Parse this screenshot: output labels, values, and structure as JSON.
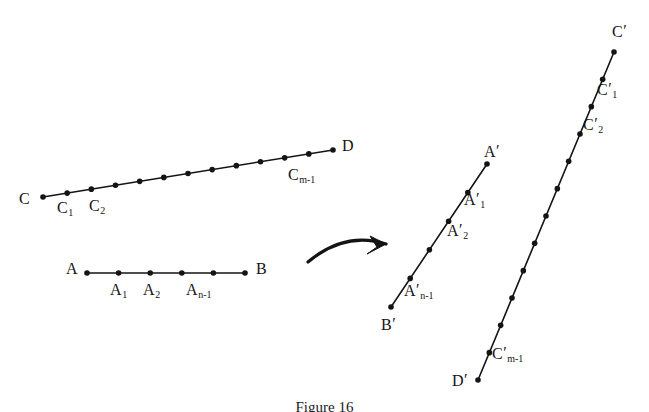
{
  "figure": {
    "caption": "Figure 16",
    "caption_top": 399,
    "background_color": "#ffffff",
    "ink_color": "#141414",
    "width": 649,
    "height": 412
  },
  "segments": [
    {
      "id": "segment-CD",
      "name": "segment-cd",
      "description": "Segment C to D divided into m equal parts",
      "start": {
        "x": 43,
        "y": 197
      },
      "end": {
        "x": 333,
        "y": 150
      },
      "point_count": 13,
      "stroke_width": 1.6,
      "dot_radius": 2.8
    },
    {
      "id": "segment-AB",
      "name": "segment-ab",
      "description": "Segment A to B divided into n equal parts",
      "start": {
        "x": 87,
        "y": 273
      },
      "end": {
        "x": 245,
        "y": 273
      },
      "point_count": 6,
      "stroke_width": 1.6,
      "dot_radius": 2.8
    },
    {
      "id": "segment-BA-prime",
      "name": "segment-b-prime-a-prime",
      "description": "Image segment B prime to A prime",
      "start": {
        "x": 391,
        "y": 307
      },
      "end": {
        "x": 487,
        "y": 164
      },
      "point_count": 6,
      "stroke_width": 1.6,
      "dot_radius": 2.8
    },
    {
      "id": "segment-DC-prime",
      "name": "segment-d-prime-c-prime",
      "description": "Image segment D prime to C prime",
      "start": {
        "x": 478,
        "y": 380
      },
      "end": {
        "x": 614,
        "y": 52
      },
      "point_count": 13,
      "stroke_width": 1.6,
      "dot_radius": 2.8
    }
  ],
  "arrow": {
    "name": "transform-arrow",
    "path": "M 308 262 Q 345 231 386 244",
    "head": "M 386 244 L 370 236 L 377 247 L 367 254 Z",
    "stroke_width": 3.2
  },
  "labels": [
    {
      "key": "C",
      "base": "C",
      "sub": "",
      "prime": false,
      "x": 19,
      "y": 191,
      "name": "label-point-c"
    },
    {
      "key": "C1",
      "base": "C",
      "sub": "1",
      "prime": false,
      "x": 57,
      "y": 200,
      "name": "label-point-c1"
    },
    {
      "key": "C2",
      "base": "C",
      "sub": "2",
      "prime": false,
      "x": 89,
      "y": 198,
      "name": "label-point-c2"
    },
    {
      "key": "Cm-1",
      "base": "C",
      "sub": "m-1",
      "prime": false,
      "x": 288,
      "y": 167,
      "name": "label-point-cm-1"
    },
    {
      "key": "D",
      "base": "D",
      "sub": "",
      "prime": false,
      "x": 342,
      "y": 138,
      "name": "label-point-d"
    },
    {
      "key": "A",
      "base": "A",
      "sub": "",
      "prime": false,
      "x": 66,
      "y": 261,
      "name": "label-point-a"
    },
    {
      "key": "A1",
      "base": "A",
      "sub": "1",
      "prime": false,
      "x": 110,
      "y": 282,
      "name": "label-point-a1"
    },
    {
      "key": "A2",
      "base": "A",
      "sub": "2",
      "prime": false,
      "x": 143,
      "y": 282,
      "name": "label-point-a2"
    },
    {
      "key": "An-1",
      "base": "A",
      "sub": "n-1",
      "prime": false,
      "x": 186,
      "y": 282,
      "name": "label-point-an-1"
    },
    {
      "key": "B",
      "base": "B",
      "sub": "",
      "prime": false,
      "x": 256,
      "y": 261,
      "name": "label-point-b"
    },
    {
      "key": "Aprime",
      "base": "A",
      "sub": "",
      "prime": true,
      "x": 484,
      "y": 143,
      "name": "label-point-a-prime"
    },
    {
      "key": "A1prime",
      "base": "A",
      "sub": "1",
      "prime": true,
      "x": 464,
      "y": 191,
      "name": "label-point-a1-prime"
    },
    {
      "key": "A2prime",
      "base": "A",
      "sub": "2",
      "prime": true,
      "x": 447,
      "y": 222,
      "name": "label-point-a2-prime"
    },
    {
      "key": "An-1prime",
      "base": "A",
      "sub": "n-1",
      "prime": true,
      "x": 404,
      "y": 282,
      "name": "label-point-an-1-prime"
    },
    {
      "key": "Bprime",
      "base": "B",
      "sub": "",
      "prime": true,
      "x": 381,
      "y": 316,
      "name": "label-point-b-prime"
    },
    {
      "key": "Cprime",
      "base": "C",
      "sub": "",
      "prime": true,
      "x": 612,
      "y": 23,
      "name": "label-point-c-prime"
    },
    {
      "key": "C1prime",
      "base": "C",
      "sub": "1",
      "prime": true,
      "x": 597,
      "y": 81,
      "name": "label-point-c1-prime"
    },
    {
      "key": "C2prime",
      "base": "C",
      "sub": "2",
      "prime": true,
      "x": 583,
      "y": 116,
      "name": "label-point-c2-prime"
    },
    {
      "key": "Cm-1prime",
      "base": "C",
      "sub": "m-1",
      "prime": true,
      "x": 492,
      "y": 345,
      "name": "label-point-cm-1-prime"
    },
    {
      "key": "Dprime",
      "base": "D",
      "sub": "",
      "prime": true,
      "x": 452,
      "y": 372,
      "name": "label-point-d-prime"
    }
  ]
}
